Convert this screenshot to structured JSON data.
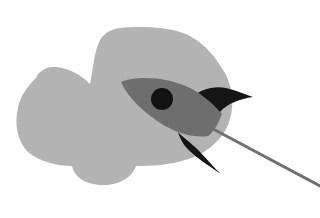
{
  "illustration": {
    "subject": "rocket-launch",
    "colors": {
      "background": "#ffffff",
      "cloud": "#b3b3b3",
      "rocket_body": "#6e6e6e",
      "rocket_window": "#111111",
      "rocket_fins": "#151515",
      "trail": "#707070"
    }
  }
}
